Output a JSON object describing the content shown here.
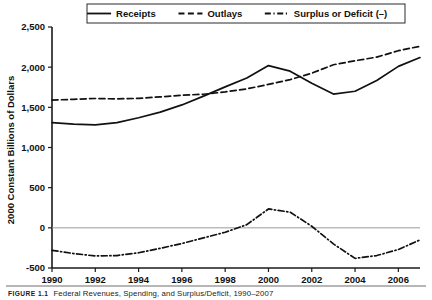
{
  "chart_data": {
    "type": "line",
    "title": "",
    "xlabel": "",
    "ylabel": "2000 Constant Billions of Dollars",
    "xlim": [
      1990,
      2007
    ],
    "ylim": [
      -500,
      2500
    ],
    "grid": false,
    "zero_line": true,
    "legend_position": "top",
    "x": [
      1990,
      1991,
      1992,
      1993,
      1994,
      1995,
      1996,
      1997,
      1998,
      1999,
      2000,
      2001,
      2002,
      2003,
      2004,
      2005,
      2006,
      2007
    ],
    "x_tick_labels": [
      "1990",
      "1992",
      "1994",
      "1996",
      "1998",
      "2000",
      "2002",
      "2004",
      "2006"
    ],
    "x_ticks": [
      1990,
      1992,
      1994,
      1996,
      1998,
      2000,
      2002,
      2004,
      2006
    ],
    "y_ticks": [
      -500,
      0,
      500,
      1000,
      1500,
      2000,
      2500
    ],
    "y_tick_labels": [
      "-500",
      "0",
      "500",
      "1,000",
      "1,500",
      "2,000",
      "2,500"
    ],
    "series": [
      {
        "name": "Receipts",
        "style": "solid",
        "color": "#111111",
        "values": [
          1310,
          1290,
          1282,
          1310,
          1370,
          1440,
          1530,
          1640,
          1755,
          1865,
          2020,
          1950,
          1800,
          1665,
          1700,
          1835,
          2010,
          2120
        ]
      },
      {
        "name": "Outlays",
        "style": "dashed",
        "color": "#111111",
        "values": [
          1590,
          1600,
          1610,
          1605,
          1612,
          1630,
          1650,
          1663,
          1692,
          1730,
          1785,
          1845,
          1925,
          2030,
          2080,
          2125,
          2205,
          2260
        ]
      },
      {
        "name": "Surplus or Deficit (–)",
        "style": "dashdot",
        "color": "#111111",
        "values": [
          -280,
          -320,
          -350,
          -345,
          -310,
          -255,
          -195,
          -125,
          -55,
          40,
          235,
          195,
          20,
          -200,
          -380,
          -345,
          -270,
          -150
        ]
      }
    ]
  },
  "legend": {
    "items": [
      {
        "label": "Receipts",
        "style": "solid"
      },
      {
        "label": "Outlays",
        "style": "dashed"
      },
      {
        "label": "Surplus or Deficit (–)",
        "style": "dashdot"
      }
    ]
  },
  "caption": {
    "number": "FIGURE 1.1",
    "title": "Federal Revenues, Spending, and Surplus/Deficit, 1990–2007"
  }
}
